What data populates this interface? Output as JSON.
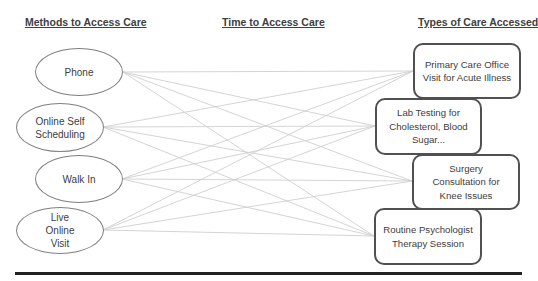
{
  "headings": {
    "methods": "Methods to Access Care",
    "time": "Time to Access Care",
    "types": "Types of Care Accessed"
  },
  "methods": [
    {
      "label": "Phone"
    },
    {
      "label": "Online Self Scheduling"
    },
    {
      "label": "Walk In"
    },
    {
      "label": "Live Online Visit"
    }
  ],
  "care_types": [
    {
      "label": "Primary Care Office Visit for Acute Illness"
    },
    {
      "label": "Lab Testing for Cholesterol, Blood Sugar..."
    },
    {
      "label": "Surgery Consultation for Knee Issues"
    },
    {
      "label": "Routine Psychologist Therapy Session"
    }
  ],
  "connections": "every method connects to every care type",
  "colors": {
    "line": "#c8c8c8",
    "oval_border": "#808080",
    "box_border": "#505050",
    "rule": "#222222"
  }
}
